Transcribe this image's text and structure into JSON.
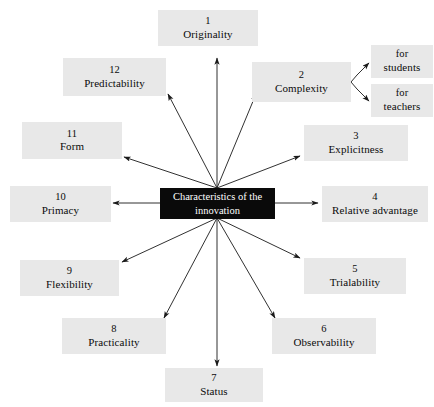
{
  "diagram": {
    "type": "radial-spoke",
    "center": {
      "label": "Characteristics of the innovation",
      "line1": "Characteristics of the",
      "line2": "innovation",
      "fill_color": "#0a0a0a",
      "text_color": "#ffffff"
    },
    "node_fill_color": "#e8e8e8",
    "background_color": "#ffffff",
    "arrow_color": "#1a1a1a",
    "nodes": [
      {
        "number": "1",
        "label": "Originality"
      },
      {
        "number": "2",
        "label": "Complexity"
      },
      {
        "number": "3",
        "label": "Explicitness"
      },
      {
        "number": "4",
        "label": "Relative advantage"
      },
      {
        "number": "5",
        "label": "Trialability"
      },
      {
        "number": "6",
        "label": "Observability"
      },
      {
        "number": "7",
        "label": "Status"
      },
      {
        "number": "8",
        "label": "Practicality"
      },
      {
        "number": "9",
        "label": "Flexibility"
      },
      {
        "number": "10",
        "label": "Primacy"
      },
      {
        "number": "11",
        "label": "Form"
      },
      {
        "number": "12",
        "label": "Predictability"
      }
    ],
    "sub_nodes": [
      {
        "line1": "for",
        "line2": "students",
        "parent": "2"
      },
      {
        "line1": "for",
        "line2": "teachers",
        "parent": "2"
      }
    ]
  }
}
